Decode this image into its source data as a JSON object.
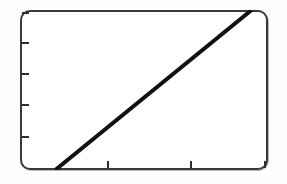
{
  "figure": {
    "background_color": "#ffffff",
    "frame_color": "#3a3a3a",
    "line_color": "#111111",
    "alt": "Line plot with rounded rectangular frame showing a single straight increasing line"
  },
  "chart_data": {
    "type": "line",
    "title": "",
    "subtitle": "",
    "xlabel": "",
    "ylabel": "",
    "grid": false,
    "legend": null,
    "legend_position": "none",
    "xlim": [
      0,
      1
    ],
    "ylim": [
      0,
      1
    ],
    "xticks": [
      0.35,
      0.69,
      1.0
    ],
    "yticks": [
      0.0,
      0.2,
      0.4,
      0.6,
      0.8
    ],
    "xticklabels": [
      "",
      "",
      ""
    ],
    "yticklabels": [
      "",
      "",
      "",
      "",
      ""
    ],
    "annotations": [],
    "series": [
      {
        "name": "",
        "x": [
          0.142,
          0.934
        ],
        "y": [
          0.0,
          1.0
        ],
        "linewidth": 4,
        "color": "#111111"
      }
    ]
  }
}
